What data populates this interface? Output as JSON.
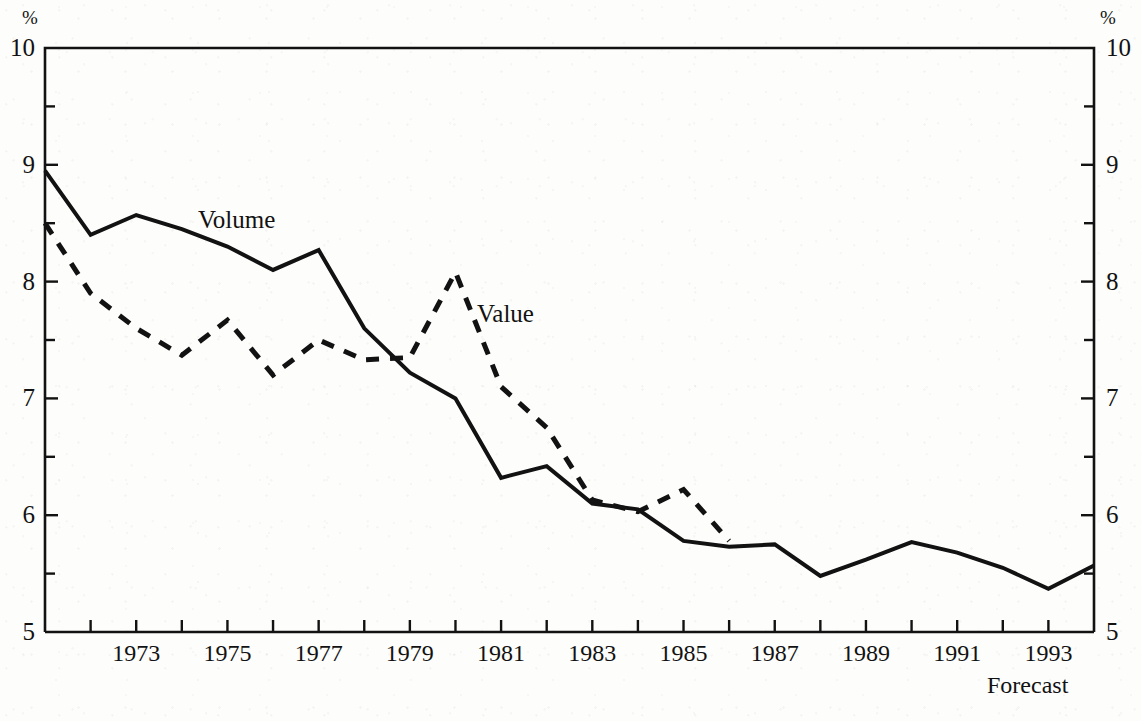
{
  "axis": {
    "left_unit": "%",
    "right_unit": "%",
    "y_ticks": [
      "10",
      "9",
      "8",
      "7",
      "6",
      "5"
    ],
    "x_tick_labels": [
      "1973",
      "1975",
      "1977",
      "1979",
      "1981",
      "1983",
      "1985",
      "1987",
      "1989",
      "1991",
      "1993"
    ]
  },
  "labels": {
    "volume": "Volume",
    "value": "Value",
    "forecast": "Forecast"
  },
  "colors": {
    "ink": "#121212",
    "paper": "#fdfdfb"
  },
  "chart_data": {
    "type": "line",
    "title": "",
    "subtitle": "",
    "xlabel": "",
    "ylabel": "%",
    "y2label": "%",
    "xlim": [
      1971,
      1994
    ],
    "ylim": [
      5,
      10
    ],
    "y_major_step": 1,
    "y_minor_step": 0.5,
    "x_tick_step": 1,
    "x_label_step": 2,
    "grid": false,
    "legend": "inline-annotations",
    "annotations": [
      {
        "text": "Volume",
        "x": 1974.6,
        "y": 8.73
      },
      {
        "text": "Value",
        "x": 1980.6,
        "y": 7.82
      },
      {
        "text": "Forecast",
        "x": 1993.4,
        "y": 4.72
      }
    ],
    "x": [
      1971,
      1972,
      1973,
      1974,
      1975,
      1976,
      1977,
      1978,
      1979,
      1980,
      1981,
      1982,
      1983,
      1984,
      1985,
      1986,
      1987,
      1988,
      1989,
      1990,
      1991,
      1992,
      1993,
      1994
    ],
    "series": [
      {
        "name": "Volume",
        "style": "solid",
        "x": [
          1971,
          1972,
          1973,
          1974,
          1975,
          1976,
          1977,
          1978,
          1979,
          1980,
          1981,
          1982,
          1983,
          1984,
          1985,
          1986,
          1987,
          1988,
          1989,
          1990,
          1991,
          1992,
          1993,
          1994
        ],
        "values": [
          8.95,
          8.4,
          8.57,
          8.45,
          8.3,
          8.1,
          8.27,
          7.6,
          7.22,
          7.0,
          6.32,
          6.42,
          6.1,
          6.05,
          5.78,
          5.73,
          5.75,
          5.48,
          5.62,
          5.77,
          5.68,
          5.55,
          5.37,
          5.57
        ]
      },
      {
        "name": "Value",
        "style": "dashed",
        "x": [
          1971,
          1972,
          1973,
          1974,
          1975,
          1976,
          1977,
          1978,
          1979,
          1980,
          1981,
          1982,
          1983,
          1984,
          1985,
          1986
        ],
        "values": [
          8.5,
          7.9,
          7.6,
          7.37,
          7.67,
          7.2,
          7.5,
          7.33,
          7.35,
          8.08,
          7.1,
          6.75,
          6.13,
          6.03,
          6.22,
          5.78
        ]
      }
    ]
  }
}
